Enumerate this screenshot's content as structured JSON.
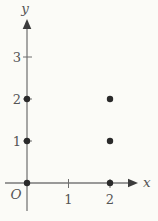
{
  "figure": {
    "background": "#fbfbf7",
    "axis_color": "#787878",
    "arrow_color": "#3c3c3c",
    "tick_color": "#6e6e6e",
    "label_color": "#555555",
    "point_color": "#2a2a2a"
  },
  "chart_data": {
    "type": "scatter",
    "title": "",
    "x_axis_label": "x",
    "y_axis_label": "y",
    "origin_label": "O",
    "x_ticks": [
      1,
      2
    ],
    "y_ticks": [
      1,
      2,
      3
    ],
    "xlim": [
      0,
      2.7
    ],
    "ylim": [
      0,
      3.9
    ],
    "grid": false,
    "legend": false,
    "points": [
      [
        0,
        0
      ],
      [
        0,
        1
      ],
      [
        0,
        2
      ],
      [
        2,
        0
      ],
      [
        2,
        1
      ],
      [
        2,
        2
      ]
    ]
  }
}
